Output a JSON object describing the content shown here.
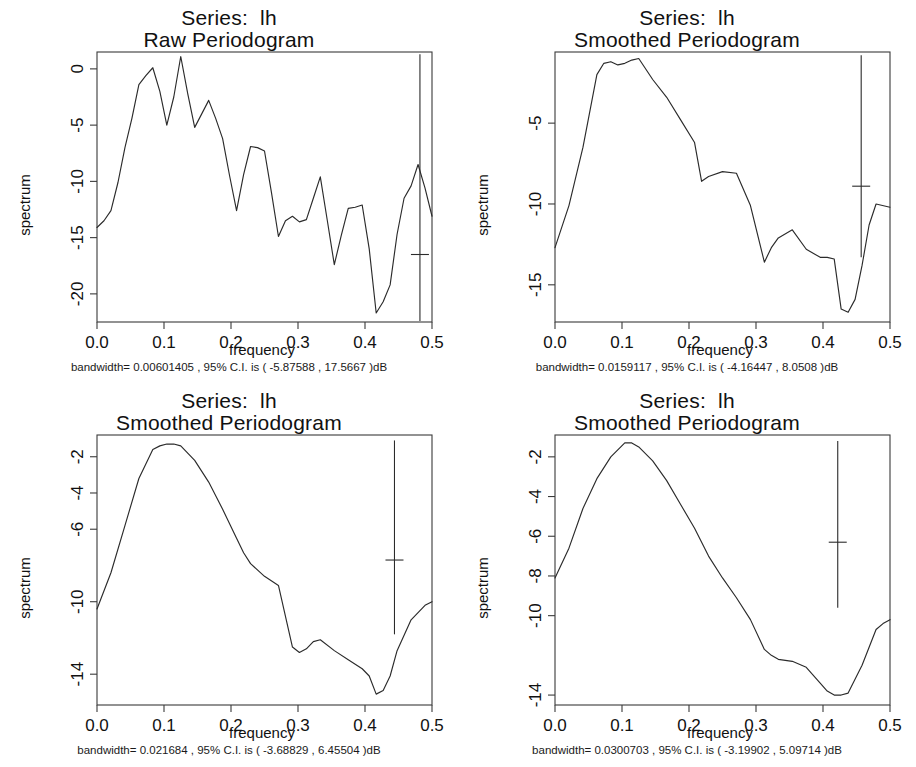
{
  "figure": {
    "background": "#ffffff",
    "line_color": "#2b2b2b",
    "axis_color": "#3a3a3a",
    "layout": "2x2 grid of spectral density plots"
  },
  "panels": [
    {
      "id": "raw-periodogram",
      "title_line1": "Series:  lh",
      "title_line2": "Raw Periodogram",
      "xlabel": "frequency",
      "ylabel": "spectrum",
      "caption": "bandwidth= 0.00601405 , 95% C.I. is ( -5.87588 , 17.5667 )dB",
      "bandwidth": "0.00601405",
      "ci_low": "-5.87588",
      "ci_high": "17.5667",
      "xticks": [
        "0.0",
        "0.1",
        "0.2",
        "0.3",
        "0.4",
        "0.5"
      ],
      "yticks": [
        "0",
        "-5",
        "-10",
        "-15",
        "-20"
      ]
    },
    {
      "id": "smoothed-periodogram-1",
      "title_line1": "Series:  lh",
      "title_line2": "Smoothed Periodogram",
      "xlabel": "frequency",
      "ylabel": "spectrum",
      "caption": "bandwidth= 0.0159117 , 95% C.I. is ( -4.16447 , 8.0508 )dB",
      "bandwidth": "0.0159117",
      "ci_low": "-4.16447",
      "ci_high": "8.0508",
      "xticks": [
        "0.0",
        "0.1",
        "0.2",
        "0.3",
        "0.4",
        "0.5"
      ],
      "yticks": [
        "-5",
        "-10",
        "-15"
      ]
    },
    {
      "id": "smoothed-periodogram-2",
      "title_line1": "Series:  lh",
      "title_line2": "Smoothed Periodogram",
      "xlabel": "frequency",
      "ylabel": "spectrum",
      "caption": "bandwidth= 0.021684 , 95% C.I. is ( -3.68829 , 6.45504 )dB",
      "bandwidth": "0.021684",
      "ci_low": "-3.68829",
      "ci_high": "6.45504",
      "xticks": [
        "0.0",
        "0.1",
        "0.2",
        "0.3",
        "0.4",
        "0.5"
      ],
      "yticks": [
        "-2",
        "-4",
        "-6",
        "-10",
        "-14"
      ]
    },
    {
      "id": "smoothed-periodogram-3",
      "title_line1": "Series:  lh",
      "title_line2": "Smoothed Periodogram",
      "xlabel": "frequency",
      "ylabel": "spectrum",
      "caption": "bandwidth= 0.0300703 , 95% C.I. is ( -3.19902 , 5.09714 )dB",
      "bandwidth": "0.0300703",
      "ci_low": "-3.19902",
      "ci_high": "5.09714",
      "xticks": [
        "0.0",
        "0.1",
        "0.2",
        "0.3",
        "0.4",
        "0.5"
      ],
      "yticks": [
        "-2",
        "-4",
        "-6",
        "-8",
        "-10",
        "-14"
      ]
    }
  ],
  "chart_data": [
    {
      "type": "line",
      "title": "Series:  lh — Raw Periodogram",
      "xlabel": "frequency",
      "ylabel": "spectrum",
      "xlim": [
        0.0,
        0.5
      ],
      "ylim": [
        -22.5,
        1.5
      ],
      "grid": false,
      "legend": "none",
      "xticks": [
        0.0,
        0.1,
        0.2,
        0.3,
        0.4,
        0.5
      ],
      "yticks": [
        0,
        -5,
        -10,
        -15,
        -20
      ],
      "x": [
        0.0,
        0.0104,
        0.0208,
        0.0313,
        0.0417,
        0.0521,
        0.0625,
        0.0729,
        0.0833,
        0.0938,
        0.1042,
        0.1146,
        0.125,
        0.1354,
        0.1458,
        0.1563,
        0.1667,
        0.1771,
        0.1875,
        0.1979,
        0.2083,
        0.2188,
        0.2292,
        0.2396,
        0.25,
        0.2604,
        0.2708,
        0.2813,
        0.2917,
        0.3021,
        0.3125,
        0.3229,
        0.3333,
        0.3438,
        0.3542,
        0.3646,
        0.375,
        0.3854,
        0.3958,
        0.4063,
        0.4167,
        0.4271,
        0.4375,
        0.4479,
        0.4583,
        0.4688,
        0.4792,
        0.4896,
        0.5
      ],
      "y": [
        -14.1,
        -13.5,
        -12.6,
        -10.1,
        -7.0,
        -4.4,
        -1.4,
        -0.6,
        0.1,
        -2.0,
        -5.0,
        -2.5,
        1.1,
        -2.2,
        -5.2,
        -4.0,
        -2.8,
        -4.4,
        -6.2,
        -9.5,
        -12.6,
        -9.4,
        -6.9,
        -7.0,
        -7.3,
        -11.0,
        -14.9,
        -13.5,
        -13.1,
        -13.6,
        -13.4,
        -11.5,
        -9.6,
        -13.5,
        -17.4,
        -14.8,
        -12.4,
        -12.3,
        -12.1,
        -16.0,
        -21.7,
        -20.7,
        -19.2,
        -14.7,
        -11.5,
        -10.4,
        -8.5,
        -10.6,
        -13.1
      ],
      "ci_bar": {
        "x": 0.482,
        "center": -16.5,
        "lower": -22.4,
        "upper": 1.3,
        "bandwidth": 0.00601405,
        "ci_low_db": -5.87588,
        "ci_high_db": 17.5667
      },
      "annotation": "bandwidth= 0.00601405 , 95% C.I. is ( -5.87588 , 17.5667 )dB"
    },
    {
      "type": "line",
      "title": "Series:  lh — Smoothed Periodogram",
      "xlabel": "frequency",
      "ylabel": "spectrum",
      "xlim": [
        0.0,
        0.5
      ],
      "ylim": [
        -17.3,
        -0.6
      ],
      "grid": false,
      "legend": "none",
      "xticks": [
        0.0,
        0.1,
        0.2,
        0.3,
        0.4,
        0.5
      ],
      "yticks": [
        -5,
        -10,
        -15
      ],
      "x": [
        0.0,
        0.0208,
        0.0417,
        0.0625,
        0.0729,
        0.0833,
        0.0938,
        0.1042,
        0.1146,
        0.125,
        0.1458,
        0.1667,
        0.1875,
        0.2083,
        0.2188,
        0.2292,
        0.25,
        0.2708,
        0.2917,
        0.3125,
        0.3229,
        0.3333,
        0.3542,
        0.375,
        0.3958,
        0.4063,
        0.4167,
        0.4271,
        0.4375,
        0.4479,
        0.4583,
        0.4688,
        0.4792,
        0.5
      ],
      "y": [
        -12.7,
        -10.1,
        -6.5,
        -2.0,
        -1.3,
        -1.2,
        -1.4,
        -1.3,
        -1.1,
        -1.0,
        -2.3,
        -3.4,
        -4.8,
        -6.2,
        -8.6,
        -8.3,
        -8.0,
        -8.1,
        -10.1,
        -13.6,
        -12.7,
        -12.1,
        -11.6,
        -12.8,
        -13.3,
        -13.3,
        -13.4,
        -16.5,
        -16.7,
        -15.9,
        -13.8,
        -11.3,
        -10.0,
        -10.2
      ],
      "ci_bar": {
        "x": 0.457,
        "center": -8.9,
        "lower": -13.3,
        "upper": -0.8,
        "bandwidth": 0.0159117,
        "ci_low_db": -4.16447,
        "ci_high_db": 8.0508
      },
      "annotation": "bandwidth= 0.0159117 , 95% C.I. is ( -4.16447 , 8.0508 )dB"
    },
    {
      "type": "line",
      "title": "Series:  lh — Smoothed Periodogram",
      "xlabel": "frequency",
      "ylabel": "spectrum",
      "xlim": [
        0.0,
        0.5
      ],
      "ylim": [
        -15.7,
        -0.8
      ],
      "grid": false,
      "legend": "none",
      "xticks": [
        0.0,
        0.1,
        0.2,
        0.3,
        0.4,
        0.5
      ],
      "yticks": [
        -2,
        -4,
        -6,
        -10,
        -14
      ],
      "x": [
        0.0,
        0.0208,
        0.0417,
        0.0625,
        0.0833,
        0.0938,
        0.1042,
        0.1146,
        0.125,
        0.1458,
        0.1667,
        0.1875,
        0.2083,
        0.2188,
        0.2292,
        0.25,
        0.2708,
        0.2917,
        0.3021,
        0.3125,
        0.3229,
        0.3333,
        0.3542,
        0.375,
        0.3958,
        0.4063,
        0.4167,
        0.4271,
        0.4375,
        0.4479,
        0.4688,
        0.4896,
        0.5
      ],
      "y": [
        -10.4,
        -8.4,
        -5.8,
        -3.2,
        -1.6,
        -1.4,
        -1.3,
        -1.3,
        -1.4,
        -2.2,
        -3.4,
        -4.9,
        -6.5,
        -7.3,
        -7.9,
        -8.6,
        -9.1,
        -12.5,
        -12.8,
        -12.6,
        -12.2,
        -12.1,
        -12.7,
        -13.2,
        -13.7,
        -14.1,
        -15.1,
        -14.9,
        -14.1,
        -12.7,
        -11.0,
        -10.2,
        -10.0
      ],
      "ci_bar": {
        "x": 0.444,
        "center": -7.7,
        "lower": -11.8,
        "upper": -1.1,
        "bandwidth": 0.021684,
        "ci_low_db": -3.68829,
        "ci_high_db": 6.45504
      },
      "annotation": "bandwidth= 0.021684 , 95% C.I. is ( -3.68829 , 6.45504 )dB"
    },
    {
      "type": "line",
      "title": "Series:  lh — Smoothed Periodogram",
      "xlabel": "frequency",
      "ylabel": "spectrum",
      "xlim": [
        0.0,
        0.5
      ],
      "ylim": [
        -14.5,
        -0.9
      ],
      "grid": false,
      "legend": "none",
      "xticks": [
        0.0,
        0.1,
        0.2,
        0.3,
        0.4,
        0.5
      ],
      "yticks": [
        -2,
        -4,
        -6,
        -8,
        -10,
        -14
      ],
      "x": [
        0.0,
        0.0208,
        0.0417,
        0.0625,
        0.0833,
        0.1042,
        0.1146,
        0.125,
        0.1458,
        0.1667,
        0.1875,
        0.2083,
        0.2292,
        0.25,
        0.2708,
        0.2917,
        0.3125,
        0.3229,
        0.3333,
        0.3542,
        0.375,
        0.3958,
        0.4063,
        0.4167,
        0.4271,
        0.4375,
        0.4583,
        0.4792,
        0.4896,
        0.5
      ],
      "y": [
        -8.1,
        -6.6,
        -4.6,
        -3.1,
        -2.0,
        -1.3,
        -1.3,
        -1.5,
        -2.2,
        -3.2,
        -4.4,
        -5.6,
        -7.0,
        -8.1,
        -9.1,
        -10.2,
        -11.7,
        -12.0,
        -12.2,
        -12.3,
        -12.6,
        -13.4,
        -13.8,
        -14.0,
        -14.0,
        -13.9,
        -12.5,
        -10.7,
        -10.4,
        -10.2
      ],
      "ci_bar": {
        "x": 0.422,
        "center": -6.3,
        "lower": -9.6,
        "upper": -1.2,
        "bandwidth": 0.0300703,
        "ci_low_db": -3.19902,
        "ci_high_db": 5.09714
      },
      "annotation": "bandwidth= 0.0300703 , 95% C.I. is ( -3.19902 , 5.09714 )dB"
    }
  ]
}
